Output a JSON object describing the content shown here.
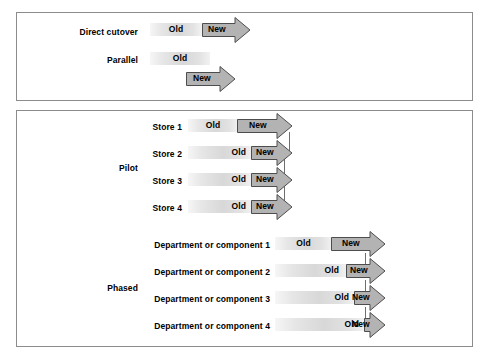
{
  "diagram": {
    "type": "timeline-diagram",
    "colors": {
      "frame_border": "#8c8c8c",
      "old_bar_fill_light": "#f6f6f6",
      "old_bar_fill_mid": "#d8d8d8",
      "new_arrow_fill": "#b3b3b3",
      "new_arrow_border": "#4d4d4d",
      "text": "#000000"
    },
    "labels": {
      "old": "Old",
      "new": "New"
    },
    "panels": [
      {
        "name": "top-panel",
        "groups": [
          {
            "name": "direct-cutover",
            "label": "Direct cutover",
            "rows": [
              {
                "label": "",
                "old": "Old",
                "new": "New"
              }
            ]
          },
          {
            "name": "parallel",
            "label": "Parallel",
            "rows": [
              {
                "label": "",
                "old": "Old",
                "new": "New"
              }
            ]
          }
        ]
      },
      {
        "name": "bottom-panel",
        "groups": [
          {
            "name": "pilot",
            "label": "Pilot",
            "rows": [
              {
                "label": "Store 1",
                "old": "Old",
                "new": "New"
              },
              {
                "label": "Store 2",
                "old": "Old",
                "new": "New"
              },
              {
                "label": "Store 3",
                "old": "Old",
                "new": "New"
              },
              {
                "label": "Store 4",
                "old": "Old",
                "new": "New"
              }
            ]
          },
          {
            "name": "phased",
            "label": "Phased",
            "rows": [
              {
                "label": "Department or component 1",
                "old": "Old",
                "new": "New"
              },
              {
                "label": "Department or component 2",
                "old": "Old",
                "new": "New"
              },
              {
                "label": "Department or component 3",
                "old": "Old",
                "new": "New"
              },
              {
                "label": "Department or component 4",
                "old": "Old",
                "new": "New"
              }
            ]
          }
        ]
      }
    ]
  }
}
